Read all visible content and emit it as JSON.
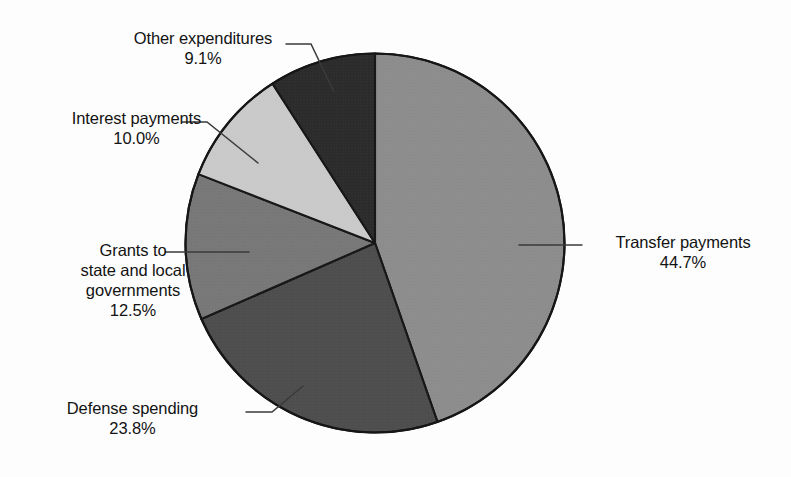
{
  "chart_data": {
    "type": "pie",
    "title": "",
    "subtitle": "",
    "xlabel": "",
    "ylabel": "",
    "legend_position": "none",
    "grid": false,
    "units": "percent",
    "categories": [
      "Transfer payments",
      "Defense spending",
      "Grants to state and local governments",
      "Interest payments",
      "Other expenditures"
    ],
    "values": [
      44.7,
      23.8,
      12.5,
      10.0,
      9.1
    ],
    "slices": [
      {
        "label": "Transfer payments",
        "label_lines": [
          "Transfer payments"
        ],
        "value": 44.7,
        "value_text": "44.7%",
        "color": "#8c8c8c",
        "start_angle_deg": 0,
        "end_angle_deg": 160.9
      },
      {
        "label": "Defense spending",
        "label_lines": [
          "Defense spending"
        ],
        "value": 23.8,
        "value_text": "23.8%",
        "color": "#4d4d4d",
        "start_angle_deg": 160.9,
        "end_angle_deg": 246.6
      },
      {
        "label": "Grants to state and local governments",
        "label_lines": [
          "Grants to",
          "state and local",
          "governments"
        ],
        "value": 12.5,
        "value_text": "12.5%",
        "color": "#777777",
        "start_angle_deg": 246.6,
        "end_angle_deg": 291.6
      },
      {
        "label": "Interest payments",
        "label_lines": [
          "Interest payments"
        ],
        "value": 10.0,
        "value_text": "10.0%",
        "color": "#c9c9c9",
        "start_angle_deg": 291.6,
        "end_angle_deg": 327.6
      },
      {
        "label": "Other expenditures",
        "label_lines": [
          "Other expenditures"
        ],
        "value": 9.1,
        "value_text": "9.1%",
        "color": "#2b2b2b",
        "start_angle_deg": 327.6,
        "end_angle_deg": 360
      }
    ]
  },
  "labels": {
    "other": {
      "line1": "Other expenditures",
      "pct": "9.1%"
    },
    "interest": {
      "line1": "Interest payments",
      "pct": "10.0%"
    },
    "grants": {
      "line1": "Grants to",
      "line2": "state and local",
      "line3": "governments",
      "pct": "12.5%"
    },
    "defense": {
      "line1": "Defense spending",
      "pct": "23.8%"
    },
    "transfer": {
      "line1": "Transfer payments",
      "pct": "44.7%"
    }
  },
  "style": {
    "background": "#fdfdfd",
    "text_color": "#131313",
    "outline_color": "#161616",
    "leader_color": "#3a3a3a"
  }
}
